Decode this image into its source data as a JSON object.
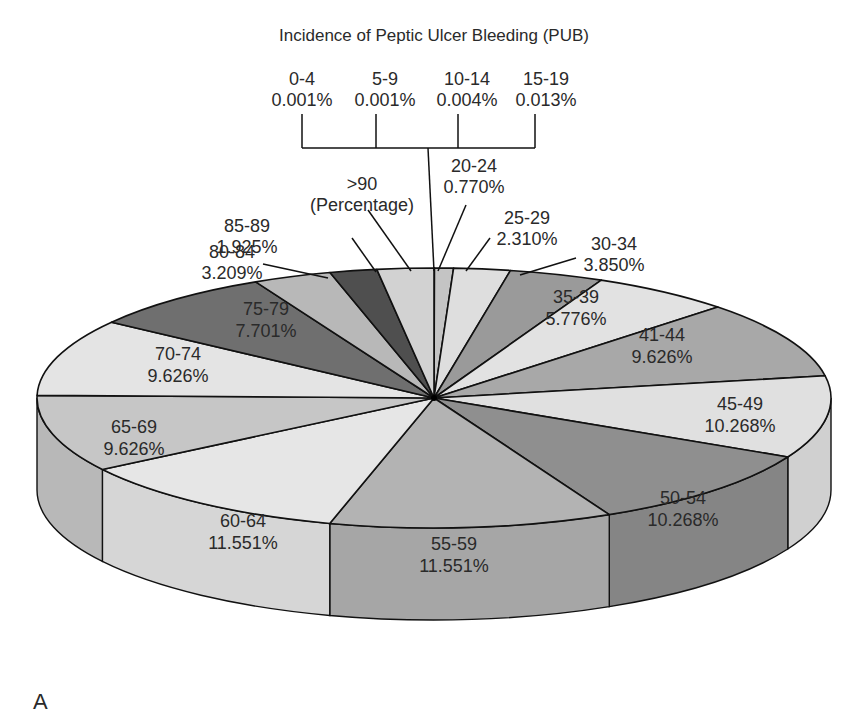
{
  "chart_data": {
    "type": "pie",
    "style": "3d-exploded-none",
    "title": "Incidence of Peptic Ulcer Bleeding (PUB)",
    "panel_label": "A",
    "unit": "Percentage",
    "slices": [
      {
        "label": "0-4",
        "value": 0.001,
        "display": "0.001%",
        "color": "#d9d9d9"
      },
      {
        "label": "5-9",
        "value": 0.001,
        "display": "0.001%",
        "color": "#d9d9d9"
      },
      {
        "label": "10-14",
        "value": 0.004,
        "display": "0.004%",
        "color": "#d9d9d9"
      },
      {
        "label": "15-19",
        "value": 0.013,
        "display": "0.013%",
        "color": "#d9d9d9"
      },
      {
        "label": "20-24",
        "value": 0.77,
        "display": "0.770%",
        "color": "#c4c4c4"
      },
      {
        "label": "25-29",
        "value": 2.31,
        "display": "2.310%",
        "color": "#dedede"
      },
      {
        "label": "30-34",
        "value": 3.85,
        "display": "3.850%",
        "color": "#9a9a9a"
      },
      {
        "label": "35-39",
        "value": 5.776,
        "display": "5.776%",
        "color": "#e2e2e2"
      },
      {
        "label": "41-44",
        "value": 9.626,
        "display": "9.626%",
        "color": "#a8a8a8"
      },
      {
        "label": "45-49",
        "value": 10.268,
        "display": "10.268%",
        "color": "#e0e0e0"
      },
      {
        "label": "50-54",
        "value": 10.268,
        "display": "10.268%",
        "color": "#8f8f8f"
      },
      {
        "label": "55-59",
        "value": 11.551,
        "display": "11.551%",
        "color": "#b3b3b3"
      },
      {
        "label": "60-64",
        "value": 11.551,
        "display": "11.551%",
        "color": "#e6e6e6"
      },
      {
        "label": "65-69",
        "value": 9.626,
        "display": "9.626%",
        "color": "#c6c6c6"
      },
      {
        "label": "70-74",
        "value": 9.626,
        "display": "9.626%",
        "color": "#e4e4e4"
      },
      {
        "label": "75-79",
        "value": 7.701,
        "display": "7.701%",
        "color": "#6f6f6f"
      },
      {
        "label": "80-84",
        "value": 3.209,
        "display": "3.209%",
        "color": "#b8b8b8"
      },
      {
        "label": "85-89",
        "value": 1.925,
        "display": "1.925%",
        "color": "#4f4f4f"
      },
      {
        "label": ">90",
        "value": 2.31,
        "display": "(Percentage)",
        "color": "#d2d2d2"
      }
    ],
    "legend": null,
    "grid": false
  },
  "labels": {
    "top_group": [
      {
        "label": "0-4",
        "display": "0.001%",
        "x": 272,
        "tick_x": 302
      },
      {
        "label": "5-9",
        "display": "0.001%",
        "x": 355,
        "tick_x": 376
      },
      {
        "label": "10-14",
        "display": "0.004%",
        "x": 437,
        "tick_x": 458
      },
      {
        "label": "15-19",
        "display": "0.013%",
        "x": 516,
        "tick_x": 535
      }
    ],
    "callouts": [
      {
        "key": "gt90",
        "line1": ">90",
        "line2": "(Percentage)",
        "tx": 362,
        "ty": 190,
        "anchor": "middle",
        "lx1": 368,
        "ly1": 210,
        "lx2": 411,
        "ly2": 271
      },
      {
        "key": "20-24",
        "line1": "20-24",
        "line2": "0.770%",
        "tx": 474,
        "ty": 172,
        "anchor": "middle",
        "lx1": 466,
        "ly1": 205,
        "lx2": 438,
        "ly2": 271
      },
      {
        "key": "25-29",
        "line1": "25-29",
        "line2": "2.310%",
        "tx": 527,
        "ty": 224,
        "anchor": "middle",
        "lx1": 490,
        "ly1": 238,
        "lx2": 466,
        "ly2": 271
      },
      {
        "key": "30-34",
        "line1": "30-34",
        "line2": "3.850%",
        "tx": 614,
        "ty": 250,
        "anchor": "middle",
        "lx1": 576,
        "ly1": 258,
        "lx2": 520,
        "ly2": 275
      },
      {
        "key": "85-89",
        "line1": "85-89",
        "line2": "1.925%",
        "tx": 247,
        "ty": 232,
        "anchor": "middle",
        "lx1": 352,
        "ly1": 238,
        "lx2": 376,
        "ly2": 272
      },
      {
        "key": "80-84",
        "line1": "80-84",
        "line2": "3.209%",
        "tx": 232,
        "ty": 258,
        "anchor": "middle",
        "lx1": 263,
        "ly1": 264,
        "lx2": 328,
        "ly2": 278
      }
    ],
    "inside": [
      {
        "key": "35-39",
        "line1": "35-39",
        "line2": "5.776%",
        "x": 576,
        "y": 303
      },
      {
        "key": "41-44",
        "line1": "41-44",
        "line2": "9.626%",
        "x": 662,
        "y": 341
      },
      {
        "key": "45-49",
        "line1": "45-49",
        "line2": "10.268%",
        "x": 740,
        "y": 410
      },
      {
        "key": "50-54",
        "line1": "50-54",
        "line2": "10.268%",
        "x": 683,
        "y": 504
      },
      {
        "key": "55-59",
        "line1": "55-59",
        "line2": "11.551%",
        "x": 454,
        "y": 550
      },
      {
        "key": "60-64",
        "line1": "60-64",
        "line2": "11.551%",
        "x": 243,
        "y": 527
      },
      {
        "key": "65-69",
        "line1": "65-69",
        "line2": "9.626%",
        "x": 134,
        "y": 433
      },
      {
        "key": "70-74",
        "line1": "70-74",
        "line2": "9.626%",
        "x": 178,
        "y": 360
      },
      {
        "key": "75-79",
        "line1": "75-79",
        "line2": "7.701%",
        "x": 266,
        "y": 315
      }
    ]
  }
}
